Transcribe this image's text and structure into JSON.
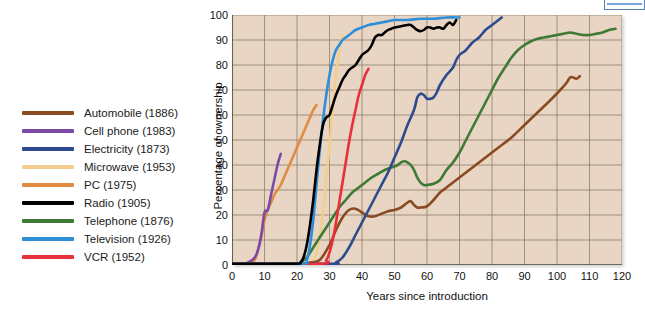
{
  "figure": {
    "x_axis_title": "Years since introduction",
    "y_axis_title": "Percentage of ownership",
    "plot_background_color": "#e8d5c3",
    "grid_color": "#8a7a6c"
  },
  "legend": {
    "items": [
      {
        "label": "Automobile (1886)",
        "color": "#8a4a22"
      },
      {
        "label": "Cell phone (1983)",
        "color": "#7b4ba3"
      },
      {
        "label": "Electricity (1873)",
        "color": "#2c4b8e"
      },
      {
        "label": "Microwave (1953)",
        "color": "#f2cf8f"
      },
      {
        "label": "PC (1975)",
        "color": "#e08a42"
      },
      {
        "label": "Radio (1905)",
        "color": "#000000"
      },
      {
        "label": "Telephone (1876)",
        "color": "#3e7a36"
      },
      {
        "label": "Television (1926)",
        "color": "#2e8fd8"
      },
      {
        "label": "VCR (1952)",
        "color": "#e8303a"
      }
    ]
  },
  "chart_data": {
    "type": "line",
    "title": "",
    "xlabel": "Years since introduction",
    "ylabel": "Percentage of ownership",
    "xlim": [
      0,
      120
    ],
    "ylim": [
      0,
      100
    ],
    "xticks": [
      0,
      10,
      20,
      30,
      40,
      50,
      60,
      70,
      80,
      90,
      100,
      110,
      120
    ],
    "yticks": [
      0,
      10,
      20,
      30,
      40,
      50,
      60,
      70,
      80,
      90,
      100
    ],
    "grid": true,
    "legend_position": "left-outside",
    "series": [
      {
        "name": "Automobile (1886)",
        "color": "#8a4a22",
        "points": [
          [
            0,
            0.5
          ],
          [
            20,
            0.5
          ],
          [
            24,
            1
          ],
          [
            27,
            2
          ],
          [
            30,
            8
          ],
          [
            32,
            14
          ],
          [
            34,
            19
          ],
          [
            36,
            22
          ],
          [
            38,
            22.5
          ],
          [
            40,
            21
          ],
          [
            42,
            19.5
          ],
          [
            44,
            19.5
          ],
          [
            46,
            20.5
          ],
          [
            48,
            21.5
          ],
          [
            50,
            22
          ],
          [
            52,
            23
          ],
          [
            54,
            25
          ],
          [
            55,
            25.5
          ],
          [
            56,
            24
          ],
          [
            57,
            23
          ],
          [
            58,
            23
          ],
          [
            60,
            23.5
          ],
          [
            62,
            26
          ],
          [
            64,
            29
          ],
          [
            66,
            31
          ],
          [
            68,
            33
          ],
          [
            70,
            35
          ],
          [
            74,
            39
          ],
          [
            78,
            43
          ],
          [
            82,
            47
          ],
          [
            86,
            51
          ],
          [
            90,
            56
          ],
          [
            94,
            61
          ],
          [
            98,
            66
          ],
          [
            101,
            70
          ],
          [
            103,
            73
          ],
          [
            104,
            75
          ],
          [
            105,
            75
          ],
          [
            106,
            74.5
          ],
          [
            107,
            75.5
          ]
        ]
      },
      {
        "name": "Cell phone (1983)",
        "color": "#7b4ba3",
        "points": [
          [
            0,
            0.5
          ],
          [
            3,
            0.5
          ],
          [
            5,
            1
          ],
          [
            7,
            3
          ],
          [
            8,
            6
          ],
          [
            9,
            12
          ],
          [
            10,
            21
          ],
          [
            11,
            22
          ],
          [
            12,
            28
          ],
          [
            13,
            34
          ],
          [
            14,
            40
          ],
          [
            15,
            44.5
          ]
        ]
      },
      {
        "name": "Electricity (1873)",
        "color": "#2c4b8e",
        "points": [
          [
            0,
            0.5
          ],
          [
            30,
            0.5
          ],
          [
            32,
            1
          ],
          [
            34,
            3
          ],
          [
            36,
            7
          ],
          [
            38,
            12
          ],
          [
            40,
            17
          ],
          [
            42,
            22
          ],
          [
            44,
            27
          ],
          [
            46,
            32
          ],
          [
            48,
            37
          ],
          [
            50,
            43
          ],
          [
            52,
            49
          ],
          [
            54,
            56
          ],
          [
            56,
            62
          ],
          [
            57,
            67
          ],
          [
            58,
            68.5
          ],
          [
            59,
            68
          ],
          [
            60,
            66.5
          ],
          [
            61,
            66.5
          ],
          [
            62,
            67
          ],
          [
            63,
            69
          ],
          [
            64,
            72
          ],
          [
            66,
            76
          ],
          [
            68,
            79
          ],
          [
            69,
            82
          ],
          [
            70,
            84
          ],
          [
            71,
            85
          ],
          [
            72,
            86
          ],
          [
            74,
            89
          ],
          [
            76,
            91
          ],
          [
            78,
            94
          ],
          [
            80,
            96
          ],
          [
            82,
            98
          ],
          [
            83,
            99
          ]
        ]
      },
      {
        "name": "Microwave (1953)",
        "color": "#f2cf8f",
        "points": [
          [
            0,
            0.5
          ],
          [
            23,
            0.5
          ],
          [
            25,
            2
          ],
          [
            26,
            5
          ],
          [
            27,
            12
          ],
          [
            28,
            22
          ],
          [
            29,
            34
          ],
          [
            30,
            48
          ],
          [
            31,
            62
          ],
          [
            32,
            76
          ],
          [
            33,
            86
          ],
          [
            34,
            92
          ]
        ]
      },
      {
        "name": "PC (1975)",
        "color": "#e08a42",
        "points": [
          [
            0,
            0.5
          ],
          [
            5,
            0.5
          ],
          [
            7,
            2
          ],
          [
            8,
            6
          ],
          [
            9,
            11
          ],
          [
            10,
            18
          ],
          [
            11,
            22
          ],
          [
            12,
            25
          ],
          [
            13,
            28
          ],
          [
            14,
            30
          ],
          [
            15,
            32
          ],
          [
            16,
            35
          ],
          [
            17,
            38
          ],
          [
            18,
            41
          ],
          [
            19,
            44
          ],
          [
            20,
            47
          ],
          [
            21,
            50
          ],
          [
            22,
            53
          ],
          [
            23,
            56
          ],
          [
            24,
            59
          ],
          [
            25,
            62
          ],
          [
            26,
            64
          ]
        ]
      },
      {
        "name": "Radio (1905)",
        "color": "#000000",
        "points": [
          [
            0,
            0.5
          ],
          [
            19,
            0.5
          ],
          [
            21,
            1
          ],
          [
            22,
            3
          ],
          [
            23,
            8
          ],
          [
            24,
            16
          ],
          [
            25,
            26
          ],
          [
            26,
            38
          ],
          [
            27,
            48
          ],
          [
            28,
            56
          ],
          [
            29,
            59
          ],
          [
            30,
            60
          ],
          [
            31,
            64
          ],
          [
            32,
            68
          ],
          [
            33,
            71
          ],
          [
            34,
            74
          ],
          [
            35,
            76
          ],
          [
            36,
            78
          ],
          [
            37,
            79
          ],
          [
            38,
            80
          ],
          [
            39,
            82
          ],
          [
            40,
            84
          ],
          [
            41,
            85
          ],
          [
            42,
            86
          ],
          [
            43,
            88
          ],
          [
            44,
            91
          ],
          [
            45,
            92
          ],
          [
            46,
            92
          ],
          [
            47,
            93
          ],
          [
            48,
            94
          ],
          [
            49,
            94.5
          ],
          [
            50,
            95
          ],
          [
            52,
            95.5
          ],
          [
            54,
            96
          ],
          [
            55,
            96
          ],
          [
            56,
            95
          ],
          [
            57,
            94
          ],
          [
            58,
            93.5
          ],
          [
            59,
            94
          ],
          [
            60,
            95
          ],
          [
            61,
            95
          ],
          [
            62,
            94.5
          ],
          [
            63,
            95
          ],
          [
            64,
            95
          ],
          [
            65,
            94.5
          ],
          [
            66,
            96
          ],
          [
            67,
            97
          ],
          [
            68,
            96
          ],
          [
            69,
            98
          ]
        ]
      },
      {
        "name": "Telephone (1876)",
        "color": "#3e7a36",
        "points": [
          [
            0,
            0.5
          ],
          [
            19,
            0.5
          ],
          [
            21,
            1
          ],
          [
            23,
            3
          ],
          [
            25,
            7
          ],
          [
            27,
            11
          ],
          [
            29,
            15
          ],
          [
            31,
            19
          ],
          [
            33,
            23
          ],
          [
            35,
            26
          ],
          [
            37,
            29
          ],
          [
            39,
            31
          ],
          [
            41,
            33
          ],
          [
            43,
            35
          ],
          [
            45,
            36.5
          ],
          [
            47,
            38
          ],
          [
            49,
            39
          ],
          [
            51,
            40
          ],
          [
            52,
            41
          ],
          [
            53,
            41.5
          ],
          [
            54,
            41
          ],
          [
            55,
            40
          ],
          [
            56,
            38
          ],
          [
            57,
            35
          ],
          [
            58,
            33
          ],
          [
            59,
            32
          ],
          [
            60,
            32
          ],
          [
            62,
            32.5
          ],
          [
            64,
            34
          ],
          [
            66,
            38
          ],
          [
            68,
            41
          ],
          [
            70,
            45
          ],
          [
            72,
            50
          ],
          [
            74,
            55
          ],
          [
            76,
            60
          ],
          [
            78,
            65
          ],
          [
            80,
            70
          ],
          [
            82,
            75
          ],
          [
            84,
            79
          ],
          [
            86,
            83
          ],
          [
            88,
            86
          ],
          [
            90,
            88
          ],
          [
            92,
            89.5
          ],
          [
            94,
            90.5
          ],
          [
            96,
            91
          ],
          [
            98,
            91.5
          ],
          [
            100,
            92
          ],
          [
            102,
            92.5
          ],
          [
            104,
            93
          ],
          [
            106,
            92.5
          ],
          [
            108,
            92
          ],
          [
            110,
            92
          ],
          [
            112,
            92.5
          ],
          [
            114,
            93
          ],
          [
            116,
            94
          ],
          [
            118,
            94.5
          ]
        ]
      },
      {
        "name": "Television (1926)",
        "color": "#2e8fd8",
        "points": [
          [
            0,
            0.5
          ],
          [
            21,
            0.5
          ],
          [
            23,
            2
          ],
          [
            24,
            8
          ],
          [
            25,
            18
          ],
          [
            26,
            32
          ],
          [
            27,
            46
          ],
          [
            28,
            58
          ],
          [
            29,
            68
          ],
          [
            30,
            76
          ],
          [
            31,
            82
          ],
          [
            32,
            86
          ],
          [
            33,
            88
          ],
          [
            34,
            90
          ],
          [
            35,
            91
          ],
          [
            36,
            92
          ],
          [
            37,
            93
          ],
          [
            38,
            94
          ],
          [
            40,
            95
          ],
          [
            42,
            96
          ],
          [
            44,
            96.5
          ],
          [
            46,
            97
          ],
          [
            48,
            97.5
          ],
          [
            50,
            98
          ],
          [
            54,
            98
          ],
          [
            58,
            98.5
          ],
          [
            62,
            98.5
          ],
          [
            66,
            99
          ],
          [
            70,
            99
          ]
        ]
      },
      {
        "name": "VCR (1952)",
        "color": "#e8303a",
        "points": [
          [
            0,
            0.5
          ],
          [
            27,
            0.5
          ],
          [
            29,
            2
          ],
          [
            30,
            5
          ],
          [
            31,
            10
          ],
          [
            32,
            17
          ],
          [
            33,
            25
          ],
          [
            34,
            33
          ],
          [
            35,
            41
          ],
          [
            36,
            49
          ],
          [
            37,
            56
          ],
          [
            38,
            62
          ],
          [
            39,
            68
          ],
          [
            40,
            72
          ],
          [
            41,
            76
          ],
          [
            42,
            78.5
          ]
        ]
      }
    ]
  }
}
